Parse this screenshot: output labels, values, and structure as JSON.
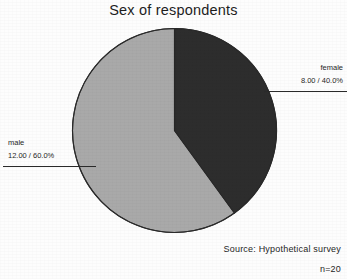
{
  "chart_data": {
    "type": "pie",
    "title": "Sex of respondents",
    "categories": [
      "female",
      "male"
    ],
    "values": [
      8,
      12
    ],
    "percentages": [
      40.0,
      60.0
    ],
    "value_labels": [
      "8.00 / 40.0%",
      "12.00 / 60.0%"
    ],
    "slice_colors": [
      "#2d2d2d",
      "#a9a9a9"
    ],
    "total": 20,
    "start_angle_deg": 0,
    "direction": "clockwise",
    "legend": "callout-labels",
    "grid": false,
    "xlabel": "",
    "ylabel": "",
    "slices": [
      {
        "label": "female",
        "value": 8,
        "percent": 40.0,
        "value_label": "8.00 / 40.0%",
        "color": "#2d2d2d",
        "sweep_deg": 144
      },
      {
        "label": "male",
        "value": 12,
        "percent": 60.0,
        "value_label": "12.00 / 60.0%",
        "color": "#a9a9a9",
        "sweep_deg": 216
      }
    ]
  },
  "footer": {
    "source": "Source: Hypothetical survey",
    "sample_size": "n=20"
  },
  "colors": {
    "background": "#fdfdfd",
    "text": "#1f1f1f",
    "outline": "#2a2a2a",
    "dark_slice": "#2d2d2d",
    "light_slice": "#a9a9a9"
  }
}
